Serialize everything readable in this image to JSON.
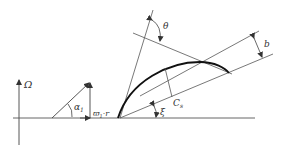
{
  "diagram": {
    "type": "blade-cascade-geometry",
    "labels": {
      "omega": "Ω",
      "alpha": "α",
      "alpha_sub": "1",
      "tangential_velocity": "ϖ",
      "tangential_velocity_sub": "1",
      "tangential_velocity_suffix": "·r",
      "theta": "θ",
      "b": "b",
      "cs": "C",
      "cs_sub": "s",
      "xi": "ξ"
    },
    "colors": {
      "line": "#444444",
      "blade": "#111111",
      "text": "#333333",
      "background": "#ffffff"
    }
  }
}
